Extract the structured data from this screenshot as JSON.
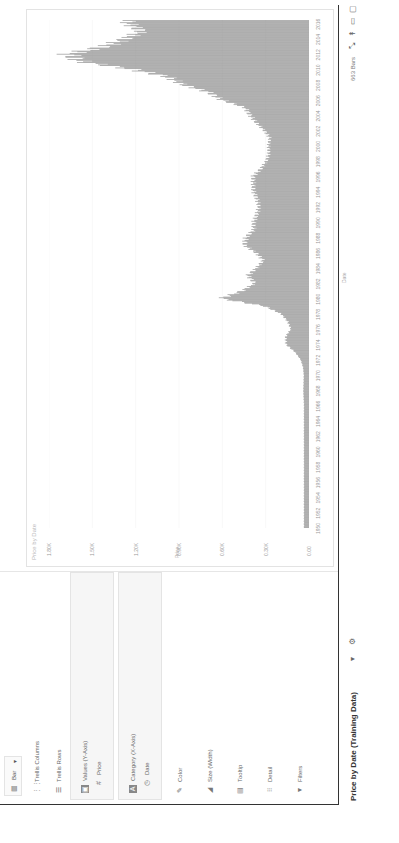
{
  "sidebar": {
    "chart_type": {
      "label": "Bar",
      "icon": "bar-chart-icon",
      "chevron": "▾"
    },
    "items": [
      {
        "label": "Trellis Columns",
        "icon": "trellis-columns-icon"
      },
      {
        "label": "Trellis Rows",
        "icon": "trellis-rows-icon"
      },
      {
        "label": "Values (Y-Axis)",
        "icon": "values-icon",
        "field": "Price",
        "field_icon": "numeric-field-icon"
      },
      {
        "label": "Category (X-Axis)",
        "icon": "category-icon",
        "field": "Date",
        "field_icon": "clock-icon"
      },
      {
        "label": "Color",
        "icon": "color-icon"
      },
      {
        "label": "Size (Width)",
        "icon": "size-icon"
      },
      {
        "label": "Tooltip",
        "icon": "tooltip-icon"
      },
      {
        "label": "Detail",
        "icon": "detail-icon"
      },
      {
        "label": "Filters",
        "icon": "filter-icon"
      }
    ]
  },
  "footer": {
    "title": "Price by Date (Training Data)",
    "chevron": "▾",
    "settings_icon": "⚙",
    "status": "663 Bars",
    "icons": [
      "collapse-icon",
      "pin-icon",
      "panel-icon",
      "window-icon"
    ]
  },
  "chart_data": {
    "type": "bar",
    "title": "Price by Date",
    "xlabel": "Date",
    "ylabel": "Price",
    "ylim": [
      0,
      1800
    ],
    "y_ticks": [
      "0.00",
      "0.30K",
      "0.60K",
      "0.90K",
      "1.20K",
      "1.50K",
      "1.80K"
    ],
    "x_ticks": [
      "1950",
      "1952",
      "1954",
      "1956",
      "1958",
      "1960",
      "1962",
      "1964",
      "1966",
      "1968",
      "1970",
      "1972",
      "1974",
      "1976",
      "1978",
      "1980",
      "1982",
      "1984",
      "1986",
      "1988",
      "1990",
      "1992",
      "1994",
      "1996",
      "1998",
      "2000",
      "2002",
      "2004",
      "2006",
      "2008",
      "2010",
      "2012",
      "2014",
      "2016"
    ],
    "bar_count": 663,
    "grid": true,
    "legend": "none",
    "series": [
      {
        "name": "Price",
        "x": [
          "1950",
          "1952",
          "1954",
          "1956",
          "1958",
          "1960",
          "1962",
          "1964",
          "1966",
          "1968",
          "1970",
          "1971",
          "1972",
          "1973",
          "1974",
          "1975",
          "1976",
          "1977",
          "1978",
          "1979",
          "1980",
          "1981",
          "1982",
          "1983",
          "1984",
          "1985",
          "1986",
          "1987",
          "1988",
          "1989",
          "1990",
          "1991",
          "1992",
          "1993",
          "1994",
          "1995",
          "1996",
          "1997",
          "1998",
          "1999",
          "2000",
          "2001",
          "2002",
          "2003",
          "2004",
          "2005",
          "2006",
          "2007",
          "2008",
          "2009",
          "2010",
          "2011",
          "2012",
          "2013",
          "2014",
          "2015",
          "2016"
        ],
        "values": [
          35,
          35,
          35,
          35,
          35,
          35,
          35,
          35,
          35,
          39,
          36,
          41,
          58,
          97,
          159,
          161,
          125,
          148,
          193,
          306,
          612,
          460,
          376,
          424,
          361,
          317,
          368,
          447,
          437,
          381,
          383,
          362,
          344,
          360,
          384,
          384,
          388,
          331,
          294,
          279,
          279,
          271,
          310,
          363,
          409,
          444,
          603,
          695,
          872,
          972,
          1224,
          1571,
          1668,
          1411,
          1266,
          1160,
          1250
        ]
      }
    ]
  }
}
